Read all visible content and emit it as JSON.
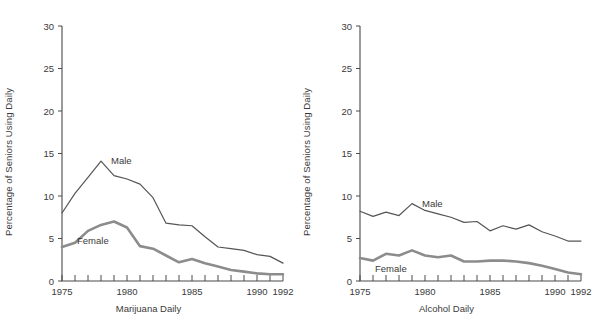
{
  "figure": {
    "title": "",
    "y_axis_label": "Percentage of Seniors Using Daily",
    "colors": {
      "male_line": "#555555",
      "female_line": "#8c8c8c",
      "axis": "#4a4a4a",
      "text": "#3a3a3a",
      "background": "#ffffff"
    }
  },
  "chart_data": [
    {
      "type": "line",
      "title": "Marijuana Daily",
      "xlabel": "Marijuana Daily",
      "ylabel": "Percentage of Seniors Using Daily",
      "xlim": [
        1975,
        1992
      ],
      "ylim": [
        0,
        30
      ],
      "yticks": [
        0,
        5,
        10,
        15,
        20,
        25,
        30
      ],
      "ytick_labels": [
        "0",
        "5",
        "10",
        "15",
        "20",
        "25",
        "30"
      ],
      "xticks": [
        1975,
        1976,
        1977,
        1978,
        1979,
        1980,
        1981,
        1982,
        1983,
        1984,
        1985,
        1986,
        1987,
        1988,
        1989,
        1990,
        1991,
        1992
      ],
      "xtick_labels_shown": [
        "1975",
        "1980",
        "1985",
        "1990",
        "1992"
      ],
      "grid": false,
      "legend": "inline-annotation",
      "x": [
        1975,
        1976,
        1977,
        1978,
        1979,
        1980,
        1981,
        1982,
        1983,
        1984,
        1985,
        1986,
        1987,
        1988,
        1989,
        1990,
        1991,
        1992
      ],
      "series": [
        {
          "name": "Male",
          "label_position": "above-right-of-peak",
          "values": [
            8.0,
            10.3,
            12.2,
            14.1,
            12.4,
            12.0,
            11.4,
            9.8,
            6.8,
            6.6,
            6.5,
            5.2,
            4.0,
            3.8,
            3.6,
            3.1,
            2.9,
            2.1
          ]
        },
        {
          "name": "Female",
          "label_position": "below-left-of-peak",
          "values": [
            4.0,
            4.5,
            5.9,
            6.6,
            7.0,
            6.3,
            4.1,
            3.8,
            3.0,
            2.2,
            2.6,
            2.1,
            1.7,
            1.3,
            1.1,
            0.9,
            0.8,
            0.8
          ]
        }
      ]
    },
    {
      "type": "line",
      "title": "Alcohol Daily",
      "xlabel": "Alcohol Daily",
      "ylabel": "Percentage of Seniors Using Daily",
      "xlim": [
        1975,
        1992
      ],
      "ylim": [
        0,
        30
      ],
      "yticks": [
        0,
        5,
        10,
        15,
        20,
        25,
        30
      ],
      "ytick_labels": [
        "0",
        "5",
        "10",
        "15",
        "20",
        "25",
        "30"
      ],
      "xticks": [
        1975,
        1976,
        1977,
        1978,
        1979,
        1980,
        1981,
        1982,
        1983,
        1984,
        1985,
        1986,
        1987,
        1988,
        1989,
        1990,
        1991,
        1992
      ],
      "xtick_labels_shown": [
        "1975",
        "1980",
        "1985",
        "1990",
        "1992"
      ],
      "grid": false,
      "legend": "inline-annotation",
      "x": [
        1975,
        1976,
        1977,
        1978,
        1979,
        1980,
        1981,
        1982,
        1983,
        1984,
        1985,
        1986,
        1987,
        1988,
        1989,
        1990,
        1991,
        1992
      ],
      "series": [
        {
          "name": "Male",
          "label_position": "above-right-of-peak",
          "values": [
            8.2,
            7.6,
            8.1,
            7.7,
            9.1,
            8.3,
            7.9,
            7.5,
            6.9,
            7.0,
            5.9,
            6.5,
            6.1,
            6.6,
            5.8,
            5.3,
            4.7,
            4.7
          ]
        },
        {
          "name": "Female",
          "label_position": "below-left-of-peak",
          "values": [
            2.7,
            2.4,
            3.2,
            3.0,
            3.6,
            3.0,
            2.8,
            3.0,
            2.3,
            2.3,
            2.4,
            2.4,
            2.3,
            2.1,
            1.8,
            1.4,
            1.0,
            0.8
          ]
        }
      ]
    }
  ],
  "panels": {
    "left": {
      "xlabel": "Marijuana Daily",
      "ylabel": "Percentage of Seniors Using Daily",
      "male_label": "Male",
      "female_label": "Female",
      "ytick_labels": [
        "0",
        "5",
        "10",
        "15",
        "20",
        "25",
        "30"
      ],
      "xtick_labels": [
        "1975",
        "1980",
        "1985",
        "1990",
        "1992"
      ]
    },
    "right": {
      "xlabel": "Alcohol Daily",
      "ylabel": "Percentage of Seniors Using Daily",
      "male_label": "Male",
      "female_label": "Female",
      "ytick_labels": [
        "0",
        "5",
        "10",
        "15",
        "20",
        "25",
        "30"
      ],
      "xtick_labels": [
        "1975",
        "1980",
        "1985",
        "1990",
        "1992"
      ]
    }
  }
}
